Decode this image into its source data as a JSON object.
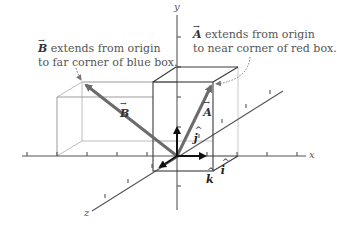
{
  "diagram": {
    "axes": {
      "x": "x",
      "y": "y",
      "z": "z"
    },
    "unit_vectors": {
      "i": "i",
      "j": "j",
      "k": "k"
    },
    "vectors": {
      "A": {
        "label": "A",
        "note_line1": "extends from origin",
        "note_line2": "to near corner of red box.",
        "note_letter": "A"
      },
      "B": {
        "label": "B",
        "note_line1": "extends from origin",
        "note_line2": "to far corner of blue box.",
        "note_letter": "B"
      }
    },
    "colors": {
      "axis": "#555555",
      "box_dark": "#3a3a3a",
      "box_light": "#bdbdbd",
      "vector": "#6b6b6b",
      "unit_vector": "#111111",
      "note_leader": "#777777"
    }
  }
}
